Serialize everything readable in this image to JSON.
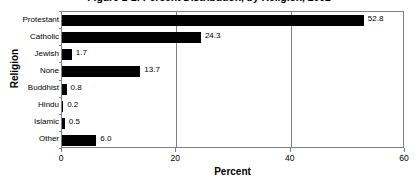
{
  "chart_data": {
    "type": "bar",
    "orientation": "horizontal",
    "title": "Figure 1-1: Percent Distribution, by Religion, 2002",
    "xlabel": "Percent",
    "ylabel": "Religion",
    "xlim": [
      0,
      60
    ],
    "xticks": [
      0,
      20,
      40,
      60
    ],
    "xtick_labels": [
      "0",
      "20",
      "40",
      "60"
    ],
    "grid": "vertical-at-xticks",
    "legend": "none",
    "bar_color": "#000000",
    "categories": [
      "Protestant",
      "Catholic",
      "Jewish",
      "None",
      "Buddhist",
      "Hindu",
      "Islamic",
      "Other"
    ],
    "values": [
      52.8,
      24.3,
      1.7,
      13.7,
      0.8,
      0.2,
      0.5,
      6.0
    ],
    "data_labels": [
      "52.8",
      "24.3",
      "1.7",
      "13.7",
      "0.8",
      "0.2",
      "0.5",
      "6.0"
    ]
  }
}
